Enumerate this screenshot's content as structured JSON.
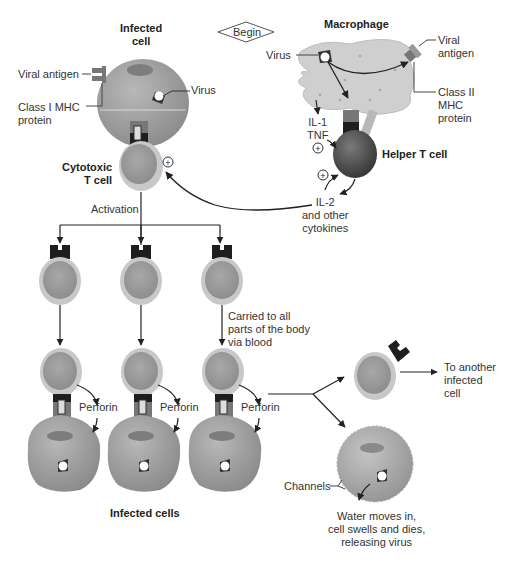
{
  "start_marker": "Begin",
  "labels": {
    "infected_cell": "Infected\ncell",
    "viral_antigen_left": "Viral antigen",
    "class_i_mhc": "Class I MHC\nprotein",
    "virus_left": "Virus",
    "cytotoxic_t_cell": "Cytotoxic\nT cell",
    "macrophage": "Macrophage",
    "virus_macrophage": "Virus",
    "viral_antigen_right": "Viral\nantigen",
    "class_ii_mhc": "Class II\nMHC\nprotein",
    "il1_tnf": "IL-1\nTNF",
    "helper_t_cell": "Helper T cell",
    "il2_cytokines": "IL-2\nand other\ncytokines",
    "activation": "Activation",
    "carried": "Carried to all\nparts of the body\nvia blood",
    "perforin_1": "Perforin",
    "perforin_2": "Perforin",
    "perforin_3": "Perforin",
    "infected_cells": "Infected cells",
    "to_another": "To another\ninfected\ncell",
    "channels": "Channels",
    "water_moves": "Water moves in,\ncell swells and dies,\nreleasing virus"
  },
  "stimulation_symbol": "+",
  "colors": {
    "cell_gray": "#9a9a9a",
    "cell_light": "#c2c2c2",
    "t_cell_halo": "#c8c8c8",
    "helper_dark": "#4a4a4a",
    "macrophage": "#cfcfcf",
    "receptor_black": "#1e1e1e",
    "arrow": "#222222"
  }
}
